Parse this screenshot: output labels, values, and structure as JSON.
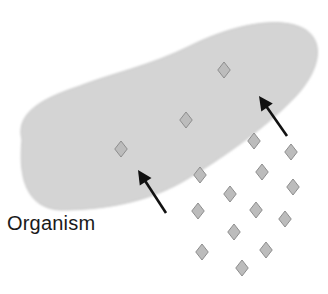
{
  "diagram": {
    "label": "Organism",
    "colors": {
      "organism_fill": "#d4d4d4",
      "organism_edge": "#c8c8c8",
      "molecule_fill": "#bcbcbc",
      "molecule_stroke": "#8e8e8e",
      "arrow": "#111111",
      "text": "#1a1a1a"
    },
    "molecules": [
      {
        "x": 224,
        "y": 70
      },
      {
        "x": 186,
        "y": 120
      },
      {
        "x": 121,
        "y": 149
      },
      {
        "x": 254,
        "y": 141
      },
      {
        "x": 291,
        "y": 152
      },
      {
        "x": 200,
        "y": 175
      },
      {
        "x": 262,
        "y": 172
      },
      {
        "x": 293,
        "y": 187
      },
      {
        "x": 230,
        "y": 194
      },
      {
        "x": 198,
        "y": 211
      },
      {
        "x": 256,
        "y": 210
      },
      {
        "x": 285,
        "y": 219
      },
      {
        "x": 234,
        "y": 232
      },
      {
        "x": 202,
        "y": 252
      },
      {
        "x": 266,
        "y": 250
      },
      {
        "x": 242,
        "y": 268
      }
    ],
    "arrows": [
      {
        "from": [
          166,
          213
        ],
        "to": [
          138,
          170
        ]
      },
      {
        "from": [
          287,
          136
        ],
        "to": [
          259,
          96
        ]
      }
    ]
  }
}
